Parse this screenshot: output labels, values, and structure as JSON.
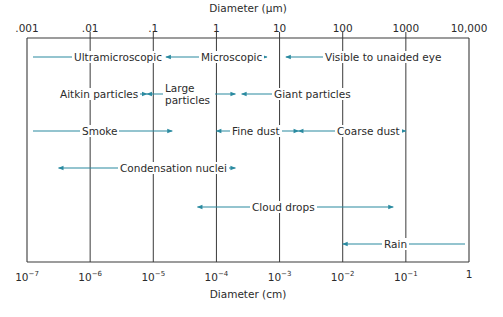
{
  "title_top": "Diameter (μm)",
  "title_bottom": "Diameter (cm)",
  "top_ticks": [
    ".001",
    ".01",
    ".1",
    "1",
    "10",
    "100",
    "1000",
    "10,000"
  ],
  "bottom_ticks": [
    {
      "base": "10",
      "exp": "−7"
    },
    {
      "base": "10",
      "exp": "−6"
    },
    {
      "base": "10",
      "exp": "−5"
    },
    {
      "base": "10",
      "exp": "−4"
    },
    {
      "base": "10",
      "exp": "−3"
    },
    {
      "base": "10",
      "exp": "−2"
    },
    {
      "base": "10",
      "exp": "−1"
    },
    {
      "base": "1",
      "exp": ""
    }
  ],
  "colors": {
    "arrow": "#2a8aa0",
    "grid": "#3a3a3a"
  },
  "ranges": [
    {
      "label": "Ultramicroscopic",
      "from_exp": -7,
      "to_exp": -5.2,
      "row": 0
    },
    {
      "label": "Microscopic",
      "from_exp": -4.8,
      "to_exp": -3.2,
      "row": 0
    },
    {
      "label": "Visible to unaided eye",
      "from_exp": -2.9,
      "to_exp": -1,
      "row": 0
    },
    {
      "label": "Aitkin particles",
      "from_exp": -6.5,
      "to_exp": -5.1,
      "row": 1
    },
    {
      "label": "Large particles",
      "from_exp": -5.1,
      "to_exp": -3.7,
      "row": 1
    },
    {
      "label": "Giant particles",
      "from_exp": -3.6,
      "to_exp": -2.2,
      "row": 1
    },
    {
      "label": "Smoke",
      "from_exp": -7,
      "to_exp": -4.7,
      "row": 2
    },
    {
      "label": "Fine dust",
      "from_exp": -4,
      "to_exp": -2.7,
      "row": 2
    },
    {
      "label": "Coarse dust",
      "from_exp": -2.7,
      "to_exp": -1,
      "row": 2
    },
    {
      "label": "Condensation nuclei",
      "from_exp": -6.5,
      "to_exp": -3.7,
      "row": 3
    },
    {
      "label": "Cloud drops",
      "from_exp": -4.3,
      "to_exp": -1.2,
      "row": 4
    },
    {
      "label": "Rain",
      "from_exp": -2,
      "to_exp": 0,
      "row": 5
    }
  ]
}
